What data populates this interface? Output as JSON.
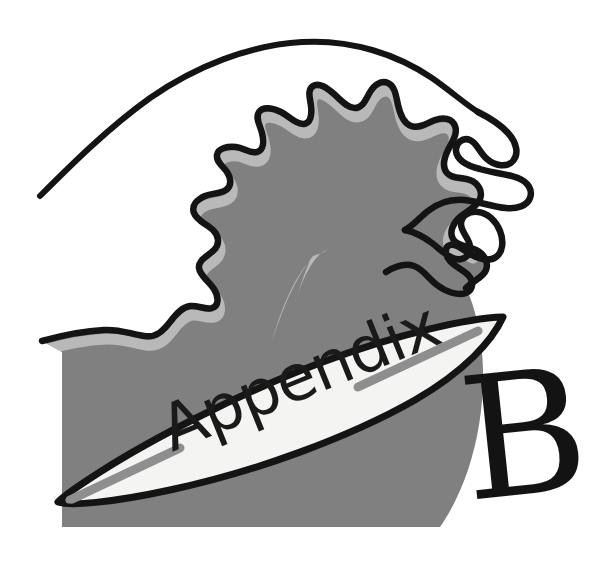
{
  "page": {
    "kind": "book-appendix-divider-illustration",
    "width": 608,
    "height": 563,
    "background_color": "#ffffff"
  },
  "illustration": {
    "title": "Appendix B surfing wave divider",
    "board_label": "Appendix",
    "chapter_letter": "B",
    "style": "hand-drawn black ink line art with flat grayscale fills"
  },
  "colors": {
    "background": "#ffffff",
    "ink_black": "#141414",
    "wave_body_gray": "#808080",
    "wave_highlight_gray": "#b9b9b9",
    "board_white": "#f4f4f2",
    "board_stripe_gray": "#8e8e8e",
    "foam_white": "#ffffff"
  },
  "elements": {
    "wave_crest_line": "wave-crest-outline",
    "wave_face": "wave-face-shape",
    "wave_highlight": "wave-inner-highlight",
    "wave_streak": "wave-spray-streak",
    "foam_tendril_upper": "foam-curl-upper",
    "foam_tendril_lower": "foam-curl-lower",
    "surfboard": "surfboard-shape",
    "stripe_upper": "board-stripe-upper-right",
    "stripe_lower": "board-stripe-lower-left",
    "label": "surfboard-label",
    "letter": "appendix-letter"
  },
  "geometry": {
    "board_rotation_deg": -22,
    "board_tip_right": [
      503,
      317
    ],
    "board_tip_left": [
      58,
      502
    ],
    "letter_position": [
      468,
      500
    ]
  }
}
